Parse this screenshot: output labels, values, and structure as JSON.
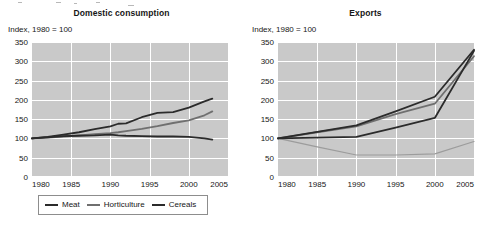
{
  "figure": {
    "background": "#ffffff",
    "plot_background": "#c9c9c9",
    "gridline_color": "#ffffff"
  },
  "colors": {
    "dark": "#2b2b2b",
    "mid_gray": "#6f6f6f",
    "light_gray": "#9c9c9c",
    "text": "#161616",
    "border": "#8d8d8d"
  },
  "panels": [
    {
      "id": "domestic-consumption",
      "title": "Domestic consumption",
      "axis_note": "Index, 1980 = 100",
      "legend": [
        {
          "label": "Meat",
          "color": "#2b2b2b"
        },
        {
          "label": "Horticulture",
          "color": "#6f6f6f"
        },
        {
          "label": "Cereals",
          "color": "#2b2b2b"
        }
      ]
    },
    {
      "id": "exports",
      "title": "Exports",
      "axis_note": "Index, 1980 = 100",
      "legend": [
        {
          "label": "Meat",
          "color": "#2b2b2b"
        },
        {
          "label": "Horticulture",
          "color": "#6f6f6f"
        },
        {
          "label": "Oilseeds",
          "color": "#2b2b2b"
        },
        {
          "label": "Traditional exports",
          "color": "#9c9c9c"
        }
      ]
    }
  ],
  "chart_data": [
    {
      "type": "line",
      "title": "Domestic consumption",
      "subtitle": "Index, 1980 = 100",
      "xlabel": "",
      "ylabel": "Index, 1980 = 100",
      "xlim": [
        1980,
        2005
      ],
      "ylim": [
        0,
        350
      ],
      "yticks": [
        0,
        50,
        100,
        150,
        200,
        250,
        300,
        350
      ],
      "xticks": [
        1980,
        1985,
        1990,
        1995,
        2000,
        2005
      ],
      "grid": true,
      "legend_position": "below",
      "x": [
        1980,
        1982,
        1984,
        1986,
        1988,
        1990,
        1991,
        1992,
        1994,
        1996,
        1998,
        2000,
        2002,
        2003
      ],
      "series": [
        {
          "name": "Meat",
          "color": "#2b2b2b",
          "values": [
            100,
            104,
            110,
            116,
            124,
            131,
            138,
            139,
            155,
            166,
            168,
            180,
            196,
            203
          ]
        },
        {
          "name": "Horticulture",
          "color": "#6f6f6f",
          "values": [
            100,
            102,
            105,
            108,
            111,
            114,
            116,
            119,
            125,
            132,
            140,
            147,
            160,
            170
          ]
        },
        {
          "name": "Cereals",
          "color": "#2b2b2b",
          "values": [
            100,
            103,
            106,
            107,
            108,
            110,
            108,
            107,
            106,
            105,
            105,
            104,
            100,
            97
          ]
        }
      ]
    },
    {
      "type": "line",
      "title": "Exports",
      "subtitle": "Index, 1980 = 100",
      "xlabel": "",
      "ylabel": "Index, 1980 = 100",
      "xlim": [
        1980,
        2005
      ],
      "ylim": [
        0,
        350
      ],
      "yticks": [
        0,
        50,
        100,
        150,
        200,
        250,
        300,
        350
      ],
      "xticks": [
        1980,
        1985,
        1990,
        1995,
        2000,
        2005
      ],
      "grid": true,
      "legend_position": "below",
      "x": [
        1980,
        1985,
        1990,
        1995,
        2000,
        2005
      ],
      "series": [
        {
          "name": "Meat",
          "color": "#2b2b2b",
          "values": [
            100,
            117,
            134,
            170,
            208,
            330
          ]
        },
        {
          "name": "Horticulture",
          "color": "#6f6f6f",
          "values": [
            100,
            116,
            131,
            163,
            190,
            313
          ]
        },
        {
          "name": "Oilseeds",
          "color": "#2b2b2b",
          "values": [
            100,
            102,
            104,
            128,
            153,
            327
          ]
        },
        {
          "name": "Traditional exports",
          "color": "#9c9c9c",
          "values": [
            100,
            78,
            57,
            57,
            60,
            92
          ]
        }
      ]
    }
  ]
}
